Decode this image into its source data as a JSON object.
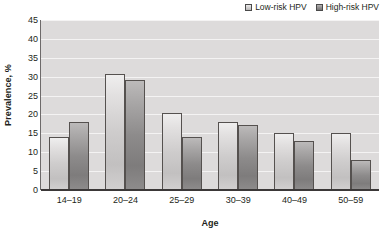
{
  "chart_data": {
    "type": "bar",
    "title": "",
    "xlabel": "Age",
    "ylabel": "Prevalence, %",
    "categories": [
      "14–19",
      "20–24",
      "25–29",
      "30–39",
      "40–49",
      "50–59"
    ],
    "series": [
      {
        "name": "Low-risk HPV",
        "color": "#cecccc",
        "values": [
          14,
          30.7,
          20.5,
          18,
          15,
          15
        ]
      },
      {
        "name": "High-risk HPV",
        "color": "#8d8b8b",
        "values": [
          18,
          29,
          14,
          17.3,
          13,
          8
        ]
      }
    ],
    "ylim": [
      0,
      45
    ],
    "yticks": [
      0,
      5,
      10,
      15,
      20,
      25,
      30,
      35,
      40,
      45
    ],
    "ytick_labels": [
      "0",
      "5",
      "10",
      "15",
      "20",
      "25",
      "30",
      "35",
      "40",
      "45"
    ],
    "grid": true,
    "grid_axis": "y",
    "legend_position": "top-right",
    "plot_background": "#dddbdb",
    "gridline_color": "#f4f3f3"
  },
  "legend": {
    "entries": [
      {
        "label": "Low-risk HPV"
      },
      {
        "label": "High-risk HPV"
      }
    ]
  },
  "axes": {
    "y_title": "Prevalence, %",
    "x_title": "Age"
  }
}
